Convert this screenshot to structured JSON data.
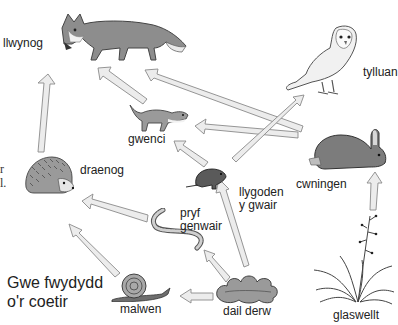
{
  "title": {
    "line1": "Gwe fwydydd",
    "line2": "o'r coetir"
  },
  "edge_text": {
    "line1": "r",
    "line2": "l."
  },
  "organisms": {
    "llwynog": {
      "label": "llwynog",
      "icon": "fox-illustration"
    },
    "tylluan": {
      "label": "tylluan",
      "icon": "owl-illustration"
    },
    "gwenci": {
      "label": "gwenci",
      "icon": "weasel-illustration"
    },
    "cwningen": {
      "label": "cwningen",
      "icon": "rabbit-illustration"
    },
    "draenog": {
      "label": "draenog",
      "icon": "hedgehog-illustration"
    },
    "llygoden": {
      "label_line1": "llygoden",
      "label_line2": "y gwair",
      "icon": "vole-illustration"
    },
    "pryf_genwair": {
      "label_line1": "pryf",
      "label_line2": "genwair",
      "icon": "earthworm-illustration"
    },
    "malwen": {
      "label": "malwen",
      "icon": "snail-illustration"
    },
    "dail_derw": {
      "label": "dail derw",
      "icon": "oak-leaves-illustration"
    },
    "glaswellt": {
      "label": "glaswellt",
      "icon": "grass-illustration"
    }
  },
  "arrows": [
    {
      "from": "draenog",
      "to": "llwynog"
    },
    {
      "from": "gwenci",
      "to": "llwynog"
    },
    {
      "from": "cwningen",
      "to": "llwynog"
    },
    {
      "from": "cwningen",
      "to": "gwenci"
    },
    {
      "from": "llygoden",
      "to": "tylluan"
    },
    {
      "from": "llygoden",
      "to": "gwenci"
    },
    {
      "from": "pryf_genwair",
      "to": "draenog"
    },
    {
      "from": "malwen",
      "to": "draenog"
    },
    {
      "from": "dail_derw",
      "to": "llygoden"
    },
    {
      "from": "dail_derw",
      "to": "pryf_genwair"
    },
    {
      "from": "dail_derw",
      "to": "malwen"
    },
    {
      "from": "glaswellt",
      "to": "cwningen"
    }
  ],
  "colors": {
    "arrow_fill": "#ececec",
    "arrow_stroke": "#8a8a8a",
    "text": "#222222"
  }
}
